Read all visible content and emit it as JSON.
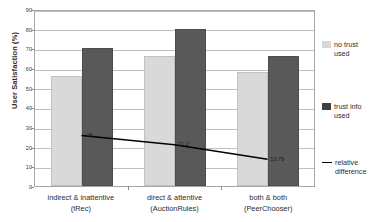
{
  "chart_data": {
    "type": "bar",
    "title": "",
    "xlabel": "",
    "ylabel": "User Satisfaction (%)",
    "ylim": [
      0,
      90
    ],
    "ytick_values": [
      0,
      10,
      20,
      30,
      40,
      50,
      60,
      70,
      80,
      90
    ],
    "grid": true,
    "legend_position": "right",
    "categories": [
      "indirect & inattentive",
      "direct & attentive",
      "both & both"
    ],
    "category_sublabels": [
      "(tRec)",
      "(AuctionRules)",
      "(PeerChooser)"
    ],
    "series": [
      {
        "name": "no trust used",
        "type": "bar",
        "color": "#d9d9d9",
        "values": [
          56,
          66,
          58
        ]
      },
      {
        "name": "trust info used",
        "type": "bar",
        "color": "#595959",
        "values": [
          70,
          80,
          66
        ]
      },
      {
        "name": "relative difference",
        "type": "line",
        "color": "#000000",
        "values": [
          26,
          21.2,
          13.79
        ]
      }
    ],
    "line_point_labels": [
      "26",
      "21.2",
      "13.79"
    ]
  },
  "axes": {
    "y_title": "User Satisfaction (%)",
    "y_ticks": [
      "90",
      "80",
      "70",
      "60",
      "50",
      "40",
      "30",
      "20",
      "10",
      "0"
    ]
  },
  "legend": {
    "items": [
      {
        "label_line1": "no trust",
        "label_line2": "used",
        "marker": "light-swatch"
      },
      {
        "label_line1": "trust info",
        "label_line2": "used",
        "marker": "dark-swatch"
      },
      {
        "label_line1": "relative",
        "label_line2": "difference",
        "marker": "line-marker"
      }
    ]
  }
}
